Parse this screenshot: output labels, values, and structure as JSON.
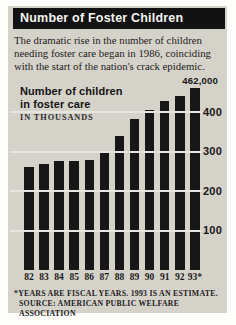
{
  "header": {
    "title": "Number of Foster Children"
  },
  "intro": {
    "lines": [
      "The dramatic rise in the number of children",
      "needing foster care began in 1986, coinciding",
      "with the start of the nation's crack epidemic."
    ]
  },
  "chart_data": {
    "type": "bar",
    "title_lines": [
      "Number of children",
      "in foster care"
    ],
    "units_label": "IN THOUSANDS",
    "categories": [
      "82",
      "83",
      "84",
      "85",
      "86",
      "87",
      "88",
      "89",
      "90",
      "91",
      "92",
      "93*"
    ],
    "values": [
      262,
      269,
      276,
      276,
      280,
      300,
      340,
      383,
      407,
      429,
      442,
      462
    ],
    "yticks": [
      400,
      300,
      200,
      100
    ],
    "ylim": [
      0,
      480
    ],
    "grid": "horizontal-white",
    "legend": "none",
    "annotation": {
      "text": "462,000",
      "category": "93*",
      "value": 462000
    }
  },
  "footnotes": {
    "lines": [
      "*YEARS ARE FISCAL YEARS. 1993 IS AN ESTIMATE.",
      "SOURCE: AMERICAN PUBLIC WELFARE ASSOCIATION"
    ]
  },
  "colors": {
    "card_bg": "#d5d2ca",
    "bar": "#171717",
    "grid": "#e7e5df",
    "title_bg": "#121212",
    "title_fg": "#f5f4f0",
    "text": "#1d1d1d"
  }
}
